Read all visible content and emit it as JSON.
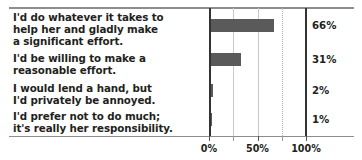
{
  "chart_data": {
    "type": "bar",
    "orientation": "horizontal",
    "title": "",
    "subtitle": "",
    "xlabel": "",
    "ylabel": "",
    "xlim": [
      0,
      100
    ],
    "grid": true,
    "legend": null,
    "categories": [
      "I'd do whatever it takes to help her and gladly make a significant effort.",
      "I'd be willing to make a reasonable effort.",
      "I would lend a hand, but I'd privately be annoyed.",
      "I'd prefer not to do much; it's really her responsibility."
    ],
    "values": [
      66,
      31,
      2,
      1
    ],
    "value_labels": [
      "66%",
      "31%",
      "2%",
      "1%"
    ],
    "tick_values": [
      0,
      50,
      100
    ],
    "tick_labels": [
      "0%",
      "50%",
      "100%"
    ],
    "minor_tick_values": [
      25,
      75
    ],
    "bar_color": "#5a5a5a",
    "axis_color": "#333333",
    "grid_color": "#c9c9c9"
  },
  "labels": {
    "row0": "I'd do whatever it takes to\nhelp her and gladly make\na significant effort.",
    "row1": "I'd be willing to make a\nreasonable effort.",
    "row2": "I would lend a hand, but\nI'd privately be annoyed.",
    "row3": "I'd prefer not to do much;\nit's really her responsibility."
  },
  "values": {
    "v0": "66%",
    "v1": "31%",
    "v2": "2%",
    "v3": "1%"
  },
  "axis": {
    "t0": "0%",
    "t1": "50%",
    "t2": "100%"
  }
}
